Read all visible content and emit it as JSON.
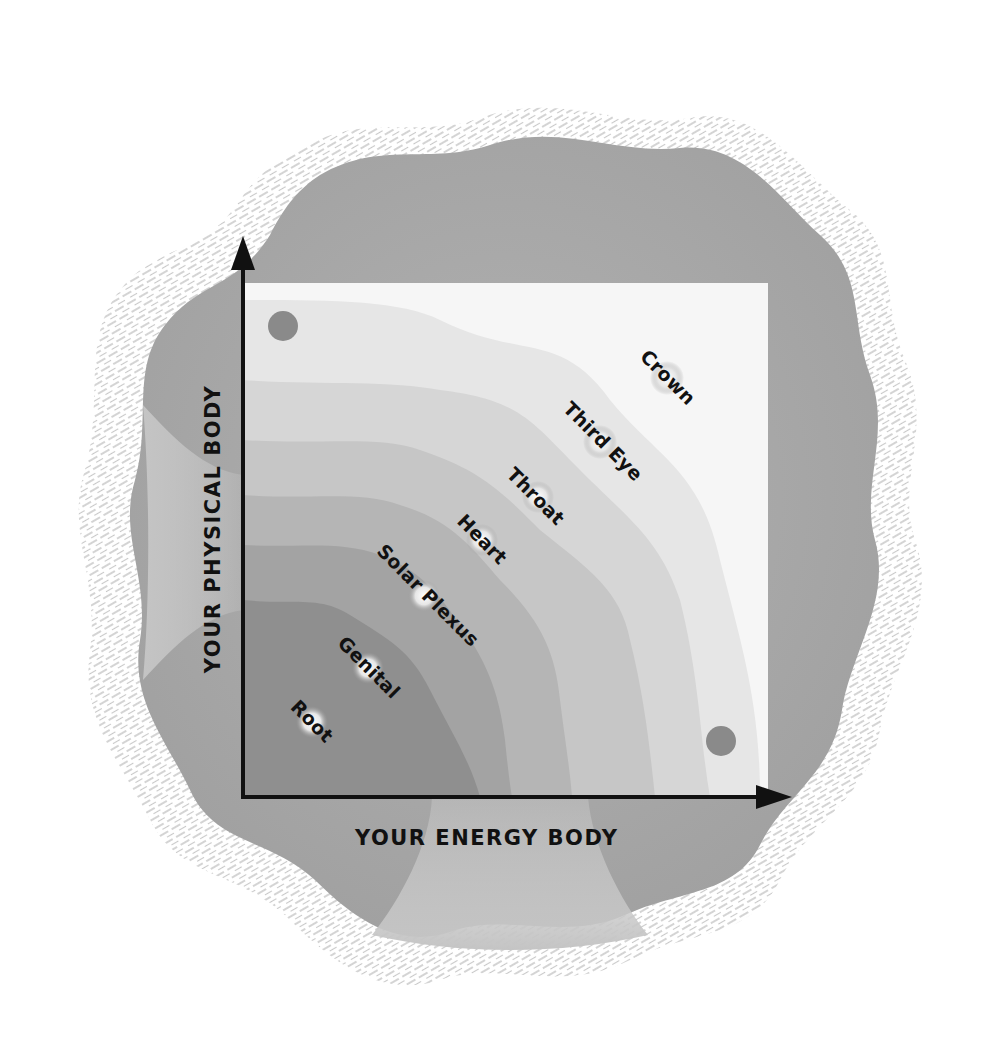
{
  "diagram": {
    "axes": {
      "x_label": "YOUR ENERGY BODY",
      "y_label": "YOUR PHYSICAL BODY"
    },
    "chakras": [
      {
        "name": "Root",
        "x": 312,
        "y": 722
      },
      {
        "name": "Genital",
        "x": 368,
        "y": 668
      },
      {
        "name": "Solar Plexus",
        "x": 424,
        "y": 596
      },
      {
        "name": "Heart",
        "x": 482,
        "y": 540
      },
      {
        "name": "Throat",
        "x": 538,
        "y": 497
      },
      {
        "name": "Third Eye",
        "x": 600,
        "y": 442
      },
      {
        "name": "Crown",
        "x": 667,
        "y": 378
      }
    ],
    "corner_dots": [
      {
        "position": "top-left",
        "x": 283,
        "y": 326
      },
      {
        "position": "bottom-right",
        "x": 721,
        "y": 741
      }
    ],
    "colors": {
      "blob": "#a9a9a9",
      "hatch": "#bdbdbd",
      "band_1": "#8f8f8f",
      "band_2": "#a3a3a3",
      "band_3": "#b5b5b5",
      "band_4": "#c6c6c6",
      "band_5": "#d6d6d6",
      "band_6": "#e6e6e6",
      "band_7": "#f6f6f6",
      "dot": "#8a8a8a",
      "axis": "#111111"
    }
  }
}
